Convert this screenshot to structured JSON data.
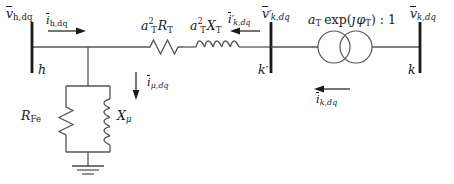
{
  "diagram": {
    "background_color": "#fefefe",
    "line_color": "#555555",
    "text_color": "#1a1a1a",
    "labels": {
      "v_h": {
        "sym": "v",
        "sub": "h,dq",
        "overline": true,
        "prime": false
      },
      "i_h": {
        "sym": "i",
        "sub": "h,dq",
        "overline": true,
        "prime": false
      },
      "bus_h": "h",
      "series_r": {
        "sym": "R",
        "sub": "T",
        "coeff_base": "a",
        "coeff_sup": "2",
        "coeff_sub": "T"
      },
      "series_x": {
        "sym": "X",
        "sub": "T",
        "coeff_base": "a",
        "coeff_sup": "2",
        "coeff_sub": "T"
      },
      "shunt_r": {
        "sym": "R",
        "sub": "Fe"
      },
      "shunt_x": {
        "sym": "X",
        "sub": "μ"
      },
      "i_mu": {
        "sym": "i",
        "sub": "μ,dq",
        "overline": true,
        "prime": false
      },
      "i_k_prime": {
        "sym": "i",
        "sub": "k,dq",
        "overline": true,
        "prime": true
      },
      "v_k_prime": {
        "sym": "v",
        "sub": "k,dq",
        "overline": true,
        "prime": true
      },
      "bus_k_prime": "k′",
      "turns_ratio": "a_T exp(ȷφ_T) : 1",
      "i_k": {
        "sym": "i",
        "sub": "k,dq",
        "overline": true,
        "prime": false
      },
      "v_k": {
        "sym": "v",
        "sub": "k,dq",
        "overline": true,
        "prime": false
      },
      "bus_k": "k"
    },
    "text": {
      "v_h_main": "v",
      "v_h_sub": "h,dq",
      "i_h_main": "i",
      "i_h_sub": "h,dq",
      "bus_h": "h",
      "rt_coeff_a": "a",
      "rt_coeff_sup": "2",
      "rt_coeff_sub": "T",
      "rt_sym": "R",
      "rt_sub": "T",
      "xt_coeff_a": "a",
      "xt_coeff_sup": "2",
      "xt_coeff_sub": "T",
      "xt_sym": "X",
      "xt_sub": "T",
      "rfe_sym": "R",
      "rfe_sub": "Fe",
      "xmu_sym": "X",
      "xmu_sub": "μ",
      "imu_main": "i",
      "imu_sub": "μ,dq",
      "ikp_main": "i",
      "ikp_sub": "k,dq",
      "vkp_main": "v",
      "vkp_sub": "k,dq",
      "bus_kp": "k",
      "bus_kp_prime": "′",
      "tr_a": "a",
      "tr_a_sub": "T",
      "tr_exp": "exp(",
      "tr_j": "ȷ",
      "tr_phi": "φ",
      "tr_phi_sub": "T",
      "tr_close": ") : 1",
      "ik_main": "i",
      "ik_sub": "k,dq",
      "vk_main": "v",
      "vk_sub": "k,dq",
      "bus_k": "k",
      "prime_mark": "′"
    },
    "components": [
      {
        "name": "bus-h",
        "type": "busbar"
      },
      {
        "name": "series-resistor",
        "type": "resistor"
      },
      {
        "name": "series-inductor",
        "type": "inductor"
      },
      {
        "name": "shunt-resistor",
        "type": "resistor"
      },
      {
        "name": "shunt-inductor",
        "type": "inductor"
      },
      {
        "name": "ground",
        "type": "ground"
      },
      {
        "name": "bus-k-prime",
        "type": "busbar"
      },
      {
        "name": "ideal-transformer",
        "type": "transformer"
      },
      {
        "name": "bus-k",
        "type": "busbar"
      }
    ]
  }
}
